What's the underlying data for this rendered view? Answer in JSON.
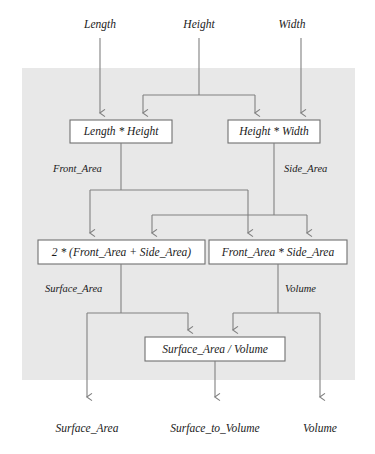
{
  "diagram": {
    "panel_color": "#e8e8e8",
    "background_color": "#ffffff",
    "wire_color": "#808080",
    "box_border_color": "#707070",
    "box_fill_color": "#ffffff",
    "inputs": [
      {
        "id": "in-length",
        "label": "Length"
      },
      {
        "id": "in-height",
        "label": "Height"
      },
      {
        "id": "in-width",
        "label": "Width"
      }
    ],
    "boxes": [
      {
        "id": "box-length-height",
        "label": "Length * Height"
      },
      {
        "id": "box-height-width",
        "label": "Height * Width"
      },
      {
        "id": "box-surface-area",
        "label": "2 * (Front_Area + Side_Area)"
      },
      {
        "id": "box-volume",
        "label": "Front_Area * Side_Area"
      },
      {
        "id": "box-ratio",
        "label": "Surface_Area / Volume"
      }
    ],
    "edge_labels": [
      {
        "id": "edge-front-area",
        "label": "Front_Area"
      },
      {
        "id": "edge-side-area",
        "label": "Side_Area"
      },
      {
        "id": "edge-surface-area",
        "label": "Surface_Area"
      },
      {
        "id": "edge-volume",
        "label": "Volume"
      }
    ],
    "outputs": [
      {
        "id": "out-surface-area",
        "label": "Surface_Area"
      },
      {
        "id": "out-surface-to-volume",
        "label": "Surface_to_Volume"
      },
      {
        "id": "out-volume",
        "label": "Volume"
      }
    ]
  }
}
